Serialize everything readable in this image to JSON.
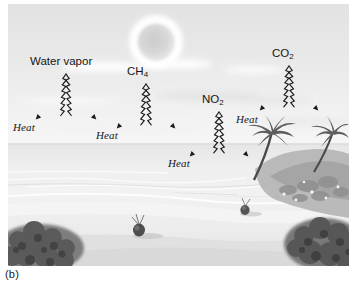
{
  "figure": {
    "caption": "(b)",
    "scene_description": "tropical beach with sun, sky, ocean, sand, palm trees and coconuts",
    "colors": {
      "sky_top": "#e4e4e4",
      "sky_bottom": "#f4f4f4",
      "sun": "#d8d8d8",
      "sun_halo": "#ffffff",
      "ocean": "#e9e9e9",
      "sand": "#f0f0f0",
      "vegetation": "#6e6e6e",
      "rock": "#9a9a9a",
      "ink": "#151515"
    }
  },
  "labels": {
    "gases": [
      {
        "id": "water-vapor",
        "text": "Water vapor",
        "formula": null,
        "sub": null,
        "x": 30,
        "y": 60
      },
      {
        "id": "methane",
        "text": "CH",
        "formula": "CH4",
        "sub": "4",
        "x": 128,
        "y": 68
      },
      {
        "id": "nitrogen-dioxide",
        "text": "NO",
        "formula": "NO2",
        "sub": "2",
        "x": 204,
        "y": 95
      },
      {
        "id": "carbon-dioxide",
        "text": "CO",
        "formula": "CO2",
        "sub": "2",
        "x": 272,
        "y": 48
      }
    ],
    "heat": [
      {
        "id": "heat-1",
        "text": "Heat",
        "x": 13,
        "y": 122
      },
      {
        "id": "heat-2",
        "text": "Heat",
        "x": 96,
        "y": 128
      },
      {
        "id": "heat-3",
        "text": "Heat",
        "x": 168,
        "y": 152
      },
      {
        "id": "heat-4",
        "text": "Heat",
        "x": 236,
        "y": 113
      }
    ]
  },
  "arrows": [
    {
      "id": "arrow-water-vapor",
      "apex_x": 58,
      "apex_y": 70,
      "left_x": 29,
      "right_x": 88,
      "base_y": 117
    },
    {
      "id": "arrow-ch4",
      "apex_x": 138,
      "apex_y": 80,
      "left_x": 110,
      "right_x": 167,
      "base_y": 125
    },
    {
      "id": "arrow-no2",
      "apex_x": 211,
      "apex_y": 108,
      "left_x": 182,
      "right_x": 240,
      "base_y": 155
    },
    {
      "id": "arrow-co2",
      "apex_x": 281,
      "apex_y": 62,
      "left_x": 253,
      "right_x": 310,
      "base_y": 110
    }
  ]
}
